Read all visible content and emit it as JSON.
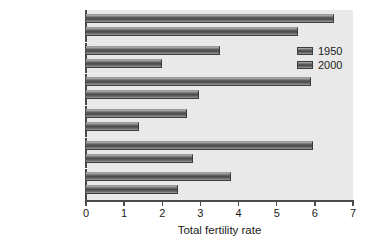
{
  "chart_data": {
    "type": "bar",
    "orientation": "horizontal",
    "title": "",
    "xlabel": "Total fertility rate",
    "ylabel": "",
    "xlim": [
      0,
      7
    ],
    "xticks": [
      0,
      1,
      2,
      3,
      4,
      5,
      6,
      7
    ],
    "grid": false,
    "legend_position": "top-right",
    "categories": [
      "Africa",
      "North America",
      "Latin America",
      "Europe",
      "Asia",
      "Oceania"
    ],
    "series": [
      {
        "name": "1950",
        "values": [
          6.5,
          3.5,
          5.9,
          2.65,
          5.95,
          3.8
        ]
      },
      {
        "name": "2000",
        "values": [
          5.55,
          2.0,
          2.95,
          1.4,
          2.8,
          2.4
        ]
      }
    ]
  },
  "colors": {
    "plot_background": "#e9e9e9",
    "page_background": "#ffffff",
    "axis": "#4a4a4a",
    "bar_dark": "#474747",
    "bar_light": "#b9b9b9",
    "text": "#1b1b1b"
  }
}
